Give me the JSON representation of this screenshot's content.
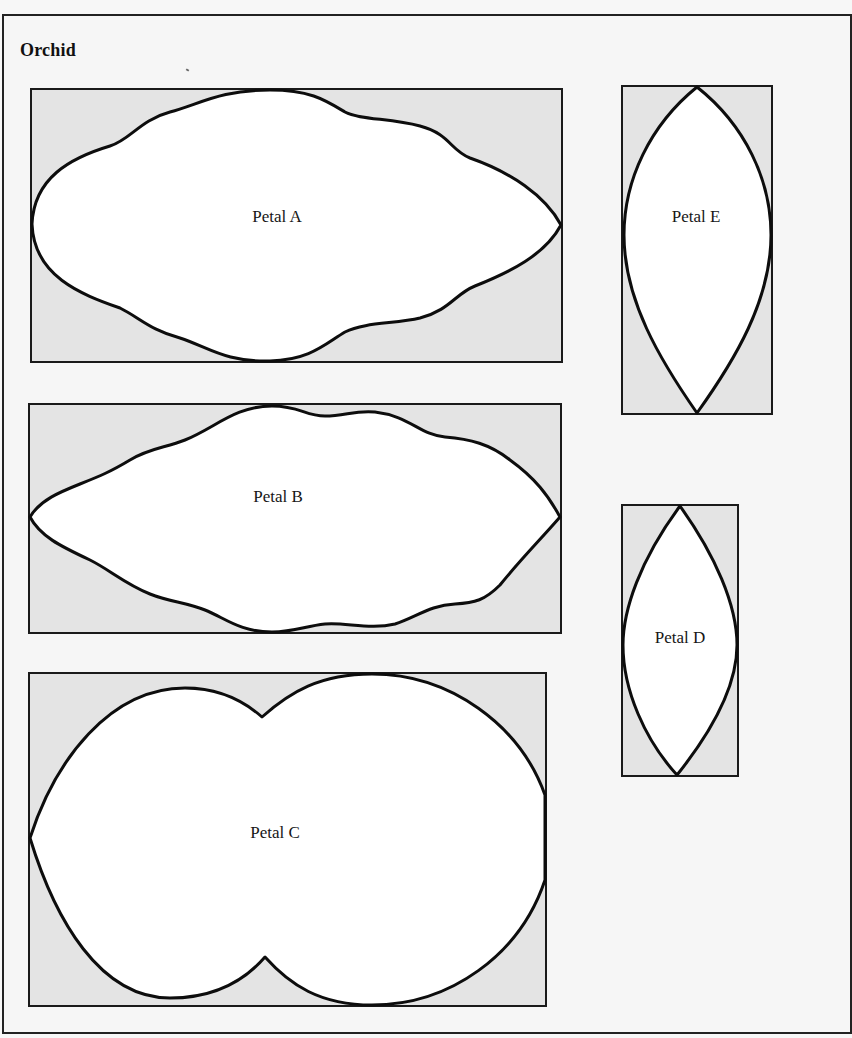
{
  "title": "Orchid",
  "colors": {
    "background": "#f6f6f6",
    "box_fill": "#e4e4e4",
    "petal_fill": "#ffffff",
    "stroke": "#0d0d0d"
  },
  "petals": [
    {
      "id": "A",
      "label": "Petal A",
      "box": {
        "x": 31,
        "y": 89,
        "w": 531,
        "h": 273
      },
      "shape": "wavy-oval"
    },
    {
      "id": "B",
      "label": "Petal B",
      "box": {
        "x": 29,
        "y": 404,
        "w": 532,
        "h": 229
      },
      "shape": "wavy-oval"
    },
    {
      "id": "C",
      "label": "Petal C",
      "box": {
        "x": 29,
        "y": 673,
        "w": 517,
        "h": 333
      },
      "shape": "double-lobe"
    },
    {
      "id": "D",
      "label": "Petal D",
      "box": {
        "x": 622,
        "y": 505,
        "w": 116,
        "h": 271
      },
      "shape": "lens"
    },
    {
      "id": "E",
      "label": "Petal E",
      "box": {
        "x": 622,
        "y": 86,
        "w": 150,
        "h": 328
      },
      "shape": "teardrop-lens"
    }
  ]
}
